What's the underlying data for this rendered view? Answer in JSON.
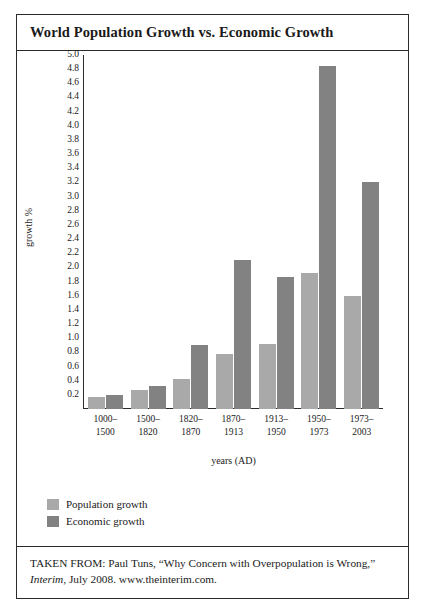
{
  "figure": {
    "title": "World Population Growth vs. Economic Growth",
    "source_prefix": "TAKEN FROM: Paul Tuns, “Why Concern with Overpopulation is Wrong,” ",
    "source_italic": "Interim",
    "source_suffix": ", July 2008. www.theinterim.com."
  },
  "colors": {
    "population": "#a9a9a9",
    "economic": "#828282",
    "ink": "#2b2b2b",
    "background": "#ffffff"
  },
  "chart_data": {
    "type": "bar",
    "title": "World Population Growth vs. Economic Growth",
    "xlabel": "years (AD)",
    "ylabel": "growth %",
    "ylim": [
      0,
      5.0
    ],
    "ytick_step": 0.2,
    "grid": false,
    "legend_position": "below-left",
    "categories": [
      "1000–1500",
      "1500–1820",
      "1820–1870",
      "1870–1913",
      "1913–1950",
      "1950–1973",
      "1973–2003"
    ],
    "category_lines": [
      [
        "1000–",
        "1500"
      ],
      [
        "1500–",
        "1820"
      ],
      [
        "1820–",
        "1870"
      ],
      [
        "1870–",
        "1913"
      ],
      [
        "1913–",
        "1950"
      ],
      [
        "1950–",
        "1973"
      ],
      [
        "1973–",
        "2003"
      ]
    ],
    "yticks": [
      "0.2",
      "0.4",
      "0.6",
      "0.8",
      "1.0",
      "1.2",
      "1.4",
      "1.6",
      "1.8",
      "2.0",
      "2.2",
      "2.4",
      "2.6",
      "2.8",
      "3.0",
      "3.2",
      "3.4",
      "3.6",
      "3.8",
      "4.0",
      "4.2",
      "4.4",
      "4.6",
      "4.8",
      "5.0"
    ],
    "series": [
      {
        "name": "Population growth",
        "color": "#a9a9a9",
        "values": [
          0.17,
          0.27,
          0.42,
          0.78,
          0.92,
          1.92,
          1.6
        ]
      },
      {
        "name": "Economic growth",
        "color": "#828282",
        "values": [
          0.2,
          0.33,
          0.9,
          2.1,
          1.87,
          4.85,
          3.2
        ]
      }
    ]
  }
}
